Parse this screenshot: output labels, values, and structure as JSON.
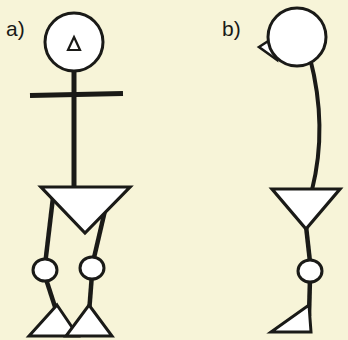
{
  "figure": {
    "width": 348,
    "height": 340,
    "background_color": "#f7f4d8",
    "stroke_color": "#1a1a17",
    "fill_color": "#ffffff",
    "caption": "Two stick-figure human body models"
  },
  "panels": [
    {
      "id": "a",
      "label": "a)",
      "label_x": 6,
      "label_y": 36,
      "view": "front view",
      "description": "Frontal stick figure: round head with triangular nose marker, straight neck, horizontal arm bar, inverted triangle torso, two legs each with a circular knee joint and a triangular foot",
      "parts": [
        {
          "name": "head",
          "shape": "circle",
          "cx": 74,
          "cy": 42,
          "r": 29
        },
        {
          "name": "nose-marker",
          "shape": "triangle-up",
          "cx": 74,
          "cy": 44,
          "size": 11
        },
        {
          "name": "neck-spine",
          "shape": "line",
          "x1": 74,
          "y1": 71,
          "x2": 74,
          "y2": 185
        },
        {
          "name": "arms-bar",
          "shape": "line",
          "x1": 30,
          "y1": 95,
          "x2": 123,
          "y2": 93
        },
        {
          "name": "torso",
          "shape": "triangle-down",
          "left_x": 41,
          "right_x": 130,
          "top_y": 186,
          "apex_x": 85,
          "apex_y": 232
        },
        {
          "name": "left-thigh",
          "shape": "line",
          "x1": 54,
          "y1": 189,
          "x2": 45,
          "y2": 264
        },
        {
          "name": "left-knee",
          "shape": "circle",
          "cx": 45,
          "cy": 270,
          "r": 11
        },
        {
          "name": "left-shin",
          "shape": "line",
          "x1": 45,
          "y1": 281,
          "x2": 57,
          "y2": 312
        },
        {
          "name": "left-foot",
          "shape": "triangle-up",
          "cx": 50,
          "cy": 326,
          "half_width": 21,
          "height": 26
        },
        {
          "name": "right-thigh",
          "shape": "line",
          "x1": 110,
          "y1": 189,
          "x2": 93,
          "y2": 262
        },
        {
          "name": "right-knee",
          "shape": "circle",
          "cx": 92,
          "cy": 268,
          "r": 11
        },
        {
          "name": "right-shin",
          "shape": "line",
          "x1": 92,
          "y1": 279,
          "x2": 89,
          "y2": 312
        },
        {
          "name": "right-foot",
          "shape": "triangle-up",
          "cx": 91,
          "cy": 326,
          "half_width": 21,
          "height": 26
        }
      ]
    },
    {
      "id": "b",
      "label": "b)",
      "label_x": 222,
      "label_y": 36,
      "view": "side view",
      "description": "Lateral stick figure: round head with a left-pointing triangular nose, gently curved spine, inverted triangle torso, single leg with a circular knee joint and a wedge-shaped foot",
      "parts": [
        {
          "name": "head",
          "shape": "circle",
          "cx": 297,
          "cy": 37,
          "r": 29
        },
        {
          "name": "nose-marker",
          "shape": "triangle-left",
          "tip_x": 259,
          "tip_y": 47,
          "base_x": 274,
          "base_top_y": 37,
          "base_bottom_y": 59
        },
        {
          "name": "spine",
          "shape": "curve",
          "x1": 311,
          "y1": 62,
          "cx": 322,
          "cy": 130,
          "x2": 312,
          "y2": 188
        },
        {
          "name": "torso",
          "shape": "triangle-down",
          "left_x": 272,
          "right_x": 340,
          "top_y": 188,
          "apex_x": 306,
          "apex_y": 228
        },
        {
          "name": "thigh",
          "shape": "line",
          "x1": 306,
          "y1": 228,
          "x2": 310,
          "y2": 261
        },
        {
          "name": "knee",
          "shape": "circle",
          "cx": 310,
          "cy": 271,
          "r": 12
        },
        {
          "name": "shin",
          "shape": "line",
          "x1": 310,
          "y1": 283,
          "x2": 309,
          "y2": 315
        },
        {
          "name": "foot",
          "shape": "triangle-wedge",
          "apex_x": 272,
          "apex_y": 333,
          "top_x": 309,
          "top_y": 307,
          "base_x": 311,
          "base_y": 333
        }
      ]
    }
  ]
}
